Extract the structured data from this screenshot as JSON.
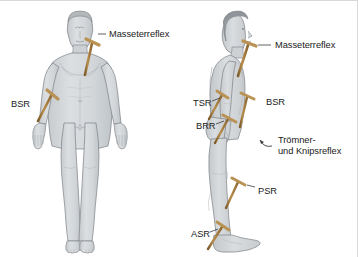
{
  "figure": {
    "views": [
      {
        "name": "anterior-view",
        "description": "Ansicht von vorn"
      },
      {
        "name": "lateral-view",
        "description": "Seitenansicht"
      }
    ],
    "colors": {
      "body_fill": "#d6d9db",
      "body_shade": "#c2c6c9",
      "body_outline": "#7c8186",
      "hair": "#9aa0a4",
      "hammer_handle": "#a87c3e",
      "hammer_handle_dark": "#8a6530",
      "hammer_head": "#b99254",
      "text": "#1a1a1a",
      "background": "#ffffff",
      "border": "#d9d9d9"
    }
  },
  "labels": {
    "anterior": [
      {
        "id": "masseterreflex-anterior",
        "text": "Masseterreflex",
        "x": 109,
        "y": 28
      },
      {
        "id": "bsr-anterior",
        "text": "BSR",
        "x": 11,
        "y": 98
      }
    ],
    "lateral": [
      {
        "id": "masseterreflex-lateral",
        "text": "Masseterreflex",
        "x": 275,
        "y": 39
      },
      {
        "id": "tsr-lateral",
        "text": "TSR",
        "x": 193,
        "y": 97
      },
      {
        "id": "bsr-lateral",
        "text": "BSR",
        "x": 266,
        "y": 96
      },
      {
        "id": "brr-lateral",
        "text": "BRR",
        "x": 196,
        "y": 120
      },
      {
        "id": "troemner-line1",
        "text": "Trömner-",
        "x": 278,
        "y": 134
      },
      {
        "id": "troemner-line2",
        "text": "und Knipsreflex",
        "x": 278,
        "y": 145
      },
      {
        "id": "psr-lateral",
        "text": "PSR",
        "x": 258,
        "y": 185
      },
      {
        "id": "asr-lateral",
        "text": "ASR",
        "x": 191,
        "y": 228
      }
    ]
  },
  "hammers": [
    {
      "id": "hammer-masseter-anterior",
      "target": "jaw"
    },
    {
      "id": "hammer-bsr-anterior",
      "target": "left-elbow"
    },
    {
      "id": "hammer-masseter-lateral",
      "target": "jaw"
    },
    {
      "id": "hammer-tsr-lateral",
      "target": "triceps"
    },
    {
      "id": "hammer-bsr-lateral",
      "target": "biceps"
    },
    {
      "id": "hammer-brr-lateral",
      "target": "brachioradialis"
    },
    {
      "id": "hammer-psr-lateral",
      "target": "patella"
    },
    {
      "id": "hammer-asr-lateral",
      "target": "achilles"
    }
  ]
}
